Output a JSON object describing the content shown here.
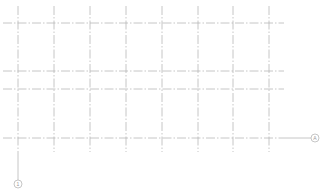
{
  "drawing": {
    "type": "structural-grid-plan",
    "line_color": "#b8b8b8",
    "background": "#ffffff",
    "vertical_gridlines_x": [
      18,
      54,
      90,
      126,
      162,
      198,
      233,
      269
    ],
    "horizontal_gridlines_y": [
      23,
      71,
      89,
      138
    ],
    "vertical_extent": {
      "top": 6,
      "bottom": 152
    },
    "horizontal_extent": {
      "left": 3,
      "right": 284
    },
    "grid_markers": [
      {
        "label": "A",
        "axis": "horizontal",
        "line_y": 138,
        "cx": 315,
        "cy": 138
      },
      {
        "label": "1",
        "axis": "vertical",
        "line_x": 18,
        "cx": 18,
        "cy": 184
      }
    ]
  }
}
